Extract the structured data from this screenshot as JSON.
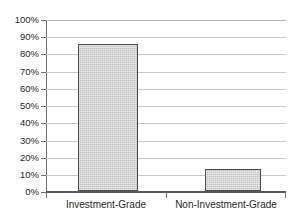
{
  "chart_data": {
    "type": "bar",
    "title": "",
    "subtitle": "",
    "xlabel": "",
    "ylabel": "",
    "categories": [
      "Investment-Grade",
      "Non-Investment-Grade"
    ],
    "values": [
      86,
      13
    ],
    "value_labels": [
      "86%",
      "13%"
    ],
    "ylim": [
      0,
      100
    ],
    "y_ticks": [
      0,
      10,
      20,
      30,
      40,
      50,
      60,
      70,
      80,
      90,
      100
    ],
    "y_tick_labels": [
      "0%",
      "10%",
      "20%",
      "30%",
      "40%",
      "50%",
      "60%",
      "70%",
      "80%",
      "90%",
      "100%"
    ],
    "grid": true,
    "grid_axis": "y",
    "legend": false,
    "legend_position": "none",
    "annotations": [],
    "series": [
      {
        "name": "Share",
        "values": [
          86,
          13
        ]
      }
    ]
  },
  "style": {
    "bar_fill": "#d4d4d4",
    "bar_border": "#4a4a4a",
    "gridline_color": "#c8c8c8",
    "axis_color": "#5a5a5a",
    "text_color": "#1f1f1f",
    "background": "#ffffff"
  },
  "axes": {
    "y_tick_0": "0%",
    "y_tick_10": "10%",
    "y_tick_20": "20%",
    "y_tick_30": "30%",
    "y_tick_40": "40%",
    "y_tick_50": "50%",
    "y_tick_60": "60%",
    "y_tick_70": "70%",
    "y_tick_80": "80%",
    "y_tick_90": "90%",
    "y_tick_100": "100%",
    "x_cat_0": "Investment-Grade",
    "x_cat_1": "Non-Investment-Grade"
  }
}
